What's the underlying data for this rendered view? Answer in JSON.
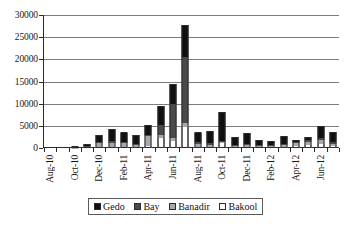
{
  "chart_data": {
    "type": "bar",
    "subtype": "stacked-column",
    "title": "",
    "xlabel": "",
    "ylabel": "",
    "ylim": [
      0,
      30000
    ],
    "ytick_labels": [
      "0",
      "5000",
      "10000",
      "15000",
      "20000",
      "25000",
      "30000"
    ],
    "ytick_values": [
      0,
      5000,
      10000,
      15000,
      20000,
      25000,
      30000
    ],
    "grid": "horizontal",
    "legend_position": "bottom",
    "x": [
      "Aug-10",
      "Sep-10",
      "Oct-10",
      "Nov-10",
      "Dec-10",
      "Jan-11",
      "Feb-11",
      "Mar-11",
      "Apr-11",
      "May-11",
      "Jun-11",
      "Jul-11",
      "Aug-11",
      "Sep-11",
      "Oct-11",
      "Nov-11",
      "Dec-11",
      "Jan-12",
      "Feb-12",
      "Mar-12",
      "Apr-12",
      "May-12",
      "Jun-12",
      "Jul-12"
    ],
    "xtick_labels_shown": [
      "Aug-10",
      "Oct-10",
      "Dec-10",
      "Feb-11",
      "Apr-11",
      "Jun-11",
      "Aug-11",
      "Oct-11",
      "Dec-11",
      "Feb-12",
      "Apr-12",
      "Jun-12"
    ],
    "series": [
      {
        "name": "Bakool",
        "color": "#ffffff",
        "values": [
          0,
          0,
          0,
          0,
          200,
          300,
          200,
          100,
          400,
          2200,
          1600,
          4700,
          300,
          200,
          1100,
          200,
          200,
          200,
          200,
          200,
          500,
          700,
          1000,
          500
        ]
      },
      {
        "name": "Banadir",
        "color": "#a8a8a8",
        "values": [
          0,
          0,
          100,
          100,
          900,
          900,
          900,
          400,
          2400,
          800,
          700,
          900,
          700,
          500,
          200,
          300,
          400,
          300,
          200,
          400,
          700,
          700,
          700,
          400
        ]
      },
      {
        "name": "Bay",
        "color": "#4a4a4a",
        "values": [
          0,
          0,
          50,
          100,
          300,
          300,
          300,
          300,
          200,
          2100,
          7700,
          14900,
          400,
          300,
          200,
          200,
          300,
          200,
          200,
          300,
          200,
          400,
          500,
          400
        ]
      },
      {
        "name": "Gedo",
        "color": "#101010",
        "values": [
          0,
          0,
          100,
          700,
          1500,
          2900,
          2100,
          2100,
          2100,
          4300,
          4400,
          7300,
          2100,
          2800,
          6700,
          1700,
          2400,
          1200,
          1000,
          1900,
          700,
          700,
          2800,
          2400
        ]
      }
    ],
    "totals": [
      0,
      0,
      250,
      900,
      2900,
      4400,
      3500,
      2900,
      5100,
      9400,
      14400,
      27800,
      3500,
      3800,
      8200,
      2400,
      3300,
      1900,
      1600,
      2800,
      1900,
      2500,
      5000,
      3700
    ]
  },
  "legend": {
    "items": [
      {
        "label": "Gedo",
        "swatch_class": "sw-gedo"
      },
      {
        "label": "Bay",
        "swatch_class": "sw-bay"
      },
      {
        "label": "Banadir",
        "swatch_class": "sw-banadir"
      },
      {
        "label": "Bakool",
        "swatch_class": "sw-bakool"
      }
    ]
  },
  "caption": {
    "text": ""
  }
}
